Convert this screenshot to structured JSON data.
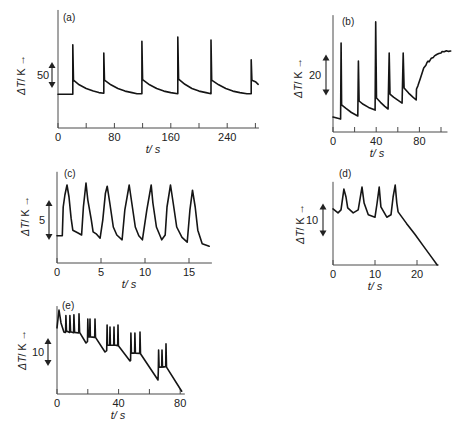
{
  "axis_arrow": "→",
  "chart_data": [
    {
      "type": "line",
      "title": "(a)",
      "xlabel": "t/ s",
      "ylabel_symbol": "ΔT",
      "ylabel_unit": "/ K",
      "ylabel": "ΔT/ K",
      "xlim": [
        0,
        285
      ],
      "ylim": [
        0,
        227
      ],
      "grid": false,
      "xticks": [
        0,
        40,
        80,
        120,
        160,
        200,
        240,
        280
      ],
      "xtick_labels": [
        "0",
        "80",
        "160",
        "240"
      ],
      "xtick_label_values": [
        0,
        80,
        160,
        240
      ],
      "scale_bar": {
        "value": 50,
        "label": "50"
      },
      "points": [
        [
          0,
          65
        ],
        [
          21,
          65
        ],
        [
          21,
          160
        ],
        [
          22,
          92
        ],
        [
          30,
          83
        ],
        [
          40,
          76
        ],
        [
          50,
          71
        ],
        [
          58,
          68
        ],
        [
          65,
          67
        ],
        [
          65,
          144
        ],
        [
          66,
          92
        ],
        [
          75,
          83
        ],
        [
          85,
          76
        ],
        [
          95,
          71
        ],
        [
          105,
          68
        ],
        [
          112,
          66
        ],
        [
          119,
          66
        ],
        [
          119,
          167
        ],
        [
          120,
          93
        ],
        [
          130,
          83
        ],
        [
          140,
          76
        ],
        [
          150,
          71
        ],
        [
          160,
          68
        ],
        [
          170,
          66
        ],
        [
          170,
          175
        ],
        [
          171,
          94
        ],
        [
          180,
          84
        ],
        [
          190,
          76
        ],
        [
          200,
          71
        ],
        [
          210,
          68
        ],
        [
          217,
          66
        ],
        [
          217,
          169
        ],
        [
          218,
          92
        ],
        [
          228,
          83
        ],
        [
          238,
          76
        ],
        [
          248,
          71
        ],
        [
          258,
          68
        ],
        [
          268,
          66
        ],
        [
          274,
          66
        ],
        [
          274,
          131
        ],
        [
          275,
          92
        ],
        [
          280,
          89
        ],
        [
          284,
          84
        ]
      ]
    },
    {
      "type": "line",
      "title": "(b)",
      "xlabel": "t/ s",
      "ylabel_symbol": "ΔT",
      "ylabel_unit": "/ K",
      "ylabel": "ΔT/ K",
      "xlim": [
        0,
        106
      ],
      "ylim": [
        0,
        57
      ],
      "grid": false,
      "xticks": [
        0,
        20,
        40,
        60,
        80,
        100
      ],
      "xtick_labels": [
        "0",
        "40",
        "80"
      ],
      "xtick_label_values": [
        0,
        40,
        80
      ],
      "scale_bar": {
        "value": 20,
        "label": "20"
      },
      "points": [
        [
          0,
          7.3
        ],
        [
          7,
          6.3
        ],
        [
          7.5,
          43.4
        ],
        [
          8,
          13.2
        ],
        [
          12,
          11.5
        ],
        [
          17,
          9.5
        ],
        [
          23,
          7.8
        ],
        [
          23.5,
          34.6
        ],
        [
          24.2,
          15.1
        ],
        [
          28,
          13.5
        ],
        [
          33,
          12
        ],
        [
          39,
          10.7
        ],
        [
          39.5,
          53.7
        ],
        [
          40.3,
          16.6
        ],
        [
          44,
          14.5
        ],
        [
          48,
          12.5
        ],
        [
          51,
          11.2
        ],
        [
          52,
          38.5
        ],
        [
          52.8,
          18.5
        ],
        [
          56,
          17
        ],
        [
          60,
          15.5
        ],
        [
          64,
          14.1
        ],
        [
          65,
          38.5
        ],
        [
          65.8,
          21.5
        ],
        [
          70,
          19
        ],
        [
          74,
          17
        ],
        [
          77,
          15.6
        ],
        [
          77.3,
          21
        ],
        [
          78.5,
          22.4
        ],
        [
          81,
          26.3
        ],
        [
          83,
          29.5
        ],
        [
          84,
          31.2
        ],
        [
          86,
          32.6
        ],
        [
          87,
          33.9
        ],
        [
          88,
          34.6
        ],
        [
          89,
          34.2
        ],
        [
          91,
          36
        ],
        [
          93,
          36.4
        ],
        [
          94,
          37.1
        ],
        [
          96,
          37.8
        ],
        [
          98,
          38.3
        ],
        [
          100,
          38.6
        ],
        [
          101,
          39.2
        ],
        [
          103,
          39.1
        ],
        [
          105,
          39.6
        ],
        [
          107,
          39.3
        ],
        [
          109,
          39.5
        ]
      ]
    },
    {
      "type": "line",
      "title": "(c)",
      "xlabel": "t/ s",
      "ylabel_symbol": "ΔT",
      "ylabel_unit": "/ K",
      "ylabel": "ΔT/ K",
      "xlim": [
        0,
        17.6
      ],
      "ylim": [
        0,
        11.4
      ],
      "grid": false,
      "xticks": [
        0,
        5,
        10,
        15
      ],
      "xtick_labels": [
        "0",
        "5",
        "10",
        "15"
      ],
      "xtick_label_values": [
        0,
        5,
        10,
        15
      ],
      "scale_bar": {
        "value": 5,
        "label": "5"
      },
      "points": [
        [
          0,
          3.4
        ],
        [
          0.6,
          3.4
        ],
        [
          0.7,
          7
        ],
        [
          0.9,
          8.5
        ],
        [
          1.14,
          9.75
        ],
        [
          1.36,
          8.25
        ],
        [
          1.6,
          5.6
        ],
        [
          1.8,
          4.1
        ],
        [
          2.4,
          3.75
        ],
        [
          2.8,
          3.5
        ],
        [
          3.0,
          7
        ],
        [
          3.3,
          10
        ],
        [
          3.5,
          7.9
        ],
        [
          3.9,
          5.4
        ],
        [
          4.1,
          3.9
        ],
        [
          4.5,
          3.6
        ],
        [
          4.9,
          3.1
        ],
        [
          5.2,
          5.4
        ],
        [
          5.5,
          8.7
        ],
        [
          5.7,
          9.6
        ],
        [
          6.0,
          7.5
        ],
        [
          6.4,
          4.5
        ],
        [
          6.8,
          3.5
        ],
        [
          7.4,
          2.9
        ],
        [
          7.7,
          6.6
        ],
        [
          8.2,
          9.75
        ],
        [
          8.5,
          7.5
        ],
        [
          8.9,
          4.5
        ],
        [
          9.3,
          3.4
        ],
        [
          9.7,
          2.9
        ],
        [
          10.2,
          6.6
        ],
        [
          10.7,
          9.75
        ],
        [
          10.9,
          7.5
        ],
        [
          11.3,
          4.5
        ],
        [
          11.9,
          2.9
        ],
        [
          12.3,
          3.5
        ],
        [
          12.5,
          7
        ],
        [
          12.9,
          9.75
        ],
        [
          13.2,
          7.5
        ],
        [
          13.6,
          4.5
        ],
        [
          14.2,
          3.2
        ],
        [
          14.8,
          2.6
        ],
        [
          15.1,
          6.6
        ],
        [
          15.4,
          9.1
        ],
        [
          15.7,
          7
        ],
        [
          16.0,
          4.1
        ],
        [
          16.5,
          2.4
        ],
        [
          17.3,
          2.1
        ]
      ]
    },
    {
      "type": "line",
      "title": "(d)",
      "xlabel": "t/ s",
      "ylabel_symbol": "ΔT",
      "ylabel_unit": "/ K",
      "ylabel": "ΔT/ K",
      "xlim": [
        0,
        25.2
      ],
      "ylim": [
        0,
        25.2
      ],
      "grid": false,
      "xticks": [
        0,
        10,
        20
      ],
      "xtick_labels": [
        "0",
        "10",
        "20"
      ],
      "xtick_label_values": [
        0,
        10,
        20
      ],
      "scale_bar": {
        "value": 10,
        "label": "10"
      },
      "points": [
        [
          0,
          17
        ],
        [
          1.2,
          15.8
        ],
        [
          1.9,
          16.7
        ],
        [
          2.6,
          23
        ],
        [
          3.1,
          20.6
        ],
        [
          3.5,
          17.3
        ],
        [
          4.8,
          15.8
        ],
        [
          6,
          16.7
        ],
        [
          6.9,
          23.6
        ],
        [
          7.4,
          18.8
        ],
        [
          8.4,
          15.2
        ],
        [
          10,
          14.5
        ],
        [
          10.5,
          18.8
        ],
        [
          11,
          23.6
        ],
        [
          11.4,
          17.6
        ],
        [
          12.8,
          14.5
        ],
        [
          13.8,
          15.2
        ],
        [
          14.3,
          20.6
        ],
        [
          14.8,
          24.2
        ],
        [
          15.2,
          18.8
        ],
        [
          15.5,
          16.1
        ],
        [
          17.5,
          12.6
        ],
        [
          19.5,
          9.3
        ],
        [
          21.5,
          5.8
        ],
        [
          23.5,
          2.3
        ],
        [
          24.8,
          0
        ]
      ]
    },
    {
      "type": "line",
      "title": "(e)",
      "xlabel": "t/ s",
      "ylabel_symbol": "ΔT",
      "ylabel_unit": "/ K",
      "ylabel": "ΔT/ K",
      "xlim": [
        0,
        83
      ],
      "ylim": [
        0,
        31.4
      ],
      "grid": false,
      "xticks": [
        0,
        20,
        40,
        60,
        80
      ],
      "xtick_labels": [
        "0",
        "40",
        "80"
      ],
      "xtick_label_values": [
        0,
        40,
        80
      ],
      "scale_bar": {
        "value": 10,
        "label": "10"
      },
      "points": [
        [
          0,
          23.6
        ],
        [
          1.3,
          30
        ],
        [
          2.6,
          25.4
        ],
        [
          4.5,
          22.1
        ],
        [
          5.6,
          22
        ],
        [
          5.8,
          28
        ],
        [
          6.2,
          22.5
        ],
        [
          8.2,
          22
        ],
        [
          8.4,
          28
        ],
        [
          8.8,
          22.2
        ],
        [
          10.8,
          21.9
        ],
        [
          11,
          28.3
        ],
        [
          11.4,
          22
        ],
        [
          14.1,
          21.8
        ],
        [
          14.3,
          28.6
        ],
        [
          14.7,
          22
        ],
        [
          18.8,
          18.2
        ],
        [
          19.8,
          18.8
        ],
        [
          20,
          26.8
        ],
        [
          20.3,
          20.5
        ],
        [
          21.2,
          20.4
        ],
        [
          21.4,
          26.8
        ],
        [
          21.7,
          20.4
        ],
        [
          24.5,
          20.2
        ],
        [
          24.7,
          26.8
        ],
        [
          25,
          20.2
        ],
        [
          31.2,
          15
        ],
        [
          32.3,
          15.5
        ],
        [
          32.5,
          24.6
        ],
        [
          32.8,
          17.5
        ],
        [
          34.2,
          17.4
        ],
        [
          34.4,
          23.9
        ],
        [
          34.7,
          17.5
        ],
        [
          36.8,
          17.4
        ],
        [
          37,
          23.9
        ],
        [
          37.3,
          17.5
        ],
        [
          39.4,
          17.3
        ],
        [
          39.6,
          24.6
        ],
        [
          39.9,
          17.2
        ],
        [
          47.4,
          11.8
        ],
        [
          47.8,
          12
        ],
        [
          48,
          21.8
        ],
        [
          48.3,
          14.6
        ],
        [
          50.4,
          14.6
        ],
        [
          50.6,
          21.8
        ],
        [
          50.9,
          14.6
        ],
        [
          53.7,
          14.5
        ],
        [
          53.9,
          22.1
        ],
        [
          54.2,
          14.4
        ],
        [
          65.6,
          5
        ],
        [
          65.8,
          8
        ],
        [
          66,
          15.7
        ],
        [
          66.3,
          9.6
        ],
        [
          68,
          9.6
        ],
        [
          68.2,
          15.7
        ],
        [
          68.5,
          9.6
        ],
        [
          70.6,
          9.8
        ],
        [
          70.8,
          17.9
        ],
        [
          71.1,
          9.6
        ],
        [
          81,
          1
        ]
      ]
    }
  ]
}
